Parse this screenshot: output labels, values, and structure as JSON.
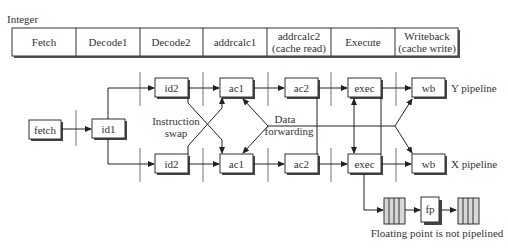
{
  "header": {
    "title": "Integer"
  },
  "stages": [
    {
      "line1": "Fetch",
      "line2": ""
    },
    {
      "line1": "Decode1",
      "line2": ""
    },
    {
      "line1": "Decode2",
      "line2": ""
    },
    {
      "line1": "addrcalc1",
      "line2": ""
    },
    {
      "line1": "addrcalc2",
      "line2": "(cache read)"
    },
    {
      "line1": "Execute",
      "line2": ""
    },
    {
      "line1": "Writeback",
      "line2": "(cache write)"
    }
  ],
  "diagram": {
    "fetch": "fetch",
    "id1": "id1",
    "y_pipe": {
      "id2": "id2",
      "ac1": "ac1",
      "ac2": "ac2",
      "exec": "exec",
      "wb": "wb",
      "label": "Y pipeline"
    },
    "x_pipe": {
      "id2": "id2",
      "ac1": "ac1",
      "ac2": "ac2",
      "exec": "exec",
      "wb": "wb",
      "label": "X pipeline"
    },
    "swap_label": {
      "line1": "Instruction",
      "line2": "swap"
    },
    "forward_label": {
      "line1": "Data",
      "line2": "forwarding"
    },
    "fp": {
      "unit": "fp",
      "caption": "Floating point is not pipelined"
    }
  },
  "colors": {
    "line": "#333333",
    "barrier": "#777777",
    "shadow": "#444444",
    "register_fill": "#d8d8d8"
  }
}
